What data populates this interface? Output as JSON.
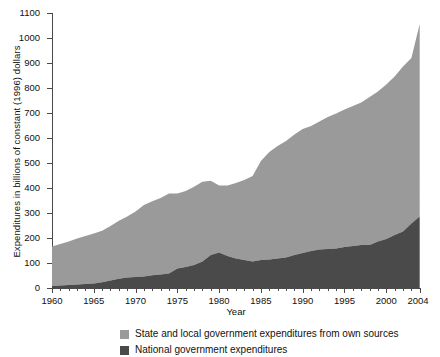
{
  "chart_data": {
    "type": "area",
    "title": "",
    "subtitle": "",
    "xlabel": "Year",
    "ylabel": "Expenditures in billions of constant (1996) dollars",
    "xlim": [
      1960,
      2004
    ],
    "ylim": [
      0,
      1100
    ],
    "ytick_step": 100,
    "xtick_labels": [
      "1960",
      "1965",
      "1970",
      "1975",
      "1980",
      "1985",
      "1990",
      "1995",
      "2000",
      "2004"
    ],
    "ytick_labels": [
      "0",
      "100",
      "200",
      "300",
      "400",
      "500",
      "600",
      "700",
      "800",
      "900",
      "1000",
      "1100"
    ],
    "grid": false,
    "stacked": true,
    "legend_position": "below",
    "legend": [
      "State and local government expenditures from own sources",
      "National government expenditures"
    ],
    "colors": {
      "state_local": "#9a9a9a",
      "national": "#4a4a4a",
      "axis": "#4a4a4a",
      "text": "#111111",
      "background": "#ffffff"
    },
    "x": [
      1960,
      1961,
      1962,
      1963,
      1964,
      1965,
      1966,
      1967,
      1968,
      1969,
      1970,
      1971,
      1972,
      1973,
      1974,
      1975,
      1976,
      1977,
      1978,
      1979,
      1980,
      1981,
      1982,
      1983,
      1984,
      1985,
      1986,
      1987,
      1988,
      1989,
      1990,
      1991,
      1992,
      1993,
      1994,
      1995,
      1996,
      1997,
      1998,
      1999,
      2000,
      2001,
      2002,
      2003,
      2004
    ],
    "series": [
      {
        "name": "National government expenditures",
        "color": "#4a4a4a",
        "values": [
          12,
          14,
          16,
          18,
          20,
          22,
          27,
          34,
          41,
          44,
          48,
          50,
          55,
          58,
          62,
          82,
          88,
          96,
          110,
          132,
          142,
          128,
          118,
          112,
          110,
          112,
          118,
          122,
          126,
          132,
          140,
          150,
          158,
          160,
          162,
          168,
          172,
          176,
          182,
          190,
          200,
          212,
          230,
          258,
          290
        ]
      },
      {
        "name": "State and local government expenditures from own sources",
        "color": "#9a9a9a",
        "values": [
          158,
          166,
          174,
          184,
          192,
          200,
          206,
          218,
          232,
          246,
          262,
          286,
          296,
          306,
          320,
          300,
          304,
          312,
          318,
          300,
          312,
          326,
          346,
          364,
          382,
          400,
          430,
          450,
          466,
          486,
          500,
          502,
          512,
          524,
          536,
          546,
          556,
          566,
          582,
          596,
          614,
          634,
          652,
          658,
          770
        ]
      }
    ],
    "totals": [
      170,
      180,
      190,
      202,
      212,
      222,
      233,
      252,
      273,
      290,
      310,
      336,
      351,
      364,
      382,
      382,
      392,
      408,
      428,
      432,
      454,
      454,
      464,
      476,
      492,
      512,
      548,
      572,
      592,
      618,
      640,
      652,
      670,
      684,
      698,
      714,
      728,
      742,
      764,
      786,
      814,
      846,
      882,
      916,
      1060
    ]
  }
}
